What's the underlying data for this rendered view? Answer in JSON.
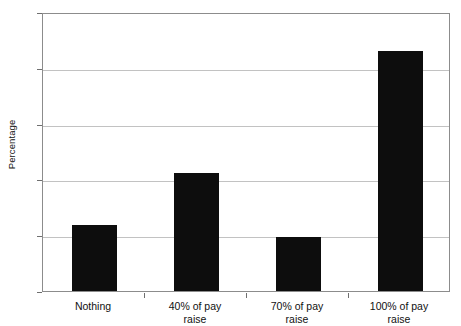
{
  "chart_data": {
    "type": "bar",
    "title": "",
    "xlabel": "",
    "ylabel": "Percentage",
    "categories": [
      "Nothing",
      "40% of pay raise",
      "70% of pay raise",
      "100% of pay raise"
    ],
    "category_lines": [
      [
        "Nothing",
        ""
      ],
      [
        "40% of pay",
        "raise"
      ],
      [
        "70% of pay",
        "raise"
      ],
      [
        "100% of pay",
        "raise"
      ]
    ],
    "values": [
      11.8,
      21.2,
      9.6,
      43.1
    ],
    "ylim": [
      0,
      50
    ],
    "yticks": [
      0,
      10,
      20,
      30,
      40,
      50
    ],
    "ytick_labels": [
      "0",
      "10",
      "20",
      "30",
      "40",
      "50"
    ],
    "grid": "horizontal",
    "legend": "none",
    "bar_color": "#0d0d0d",
    "gridline_color": "#c2c2c2",
    "frame_color": "#8c8c8c",
    "background": "#ffffff"
  }
}
